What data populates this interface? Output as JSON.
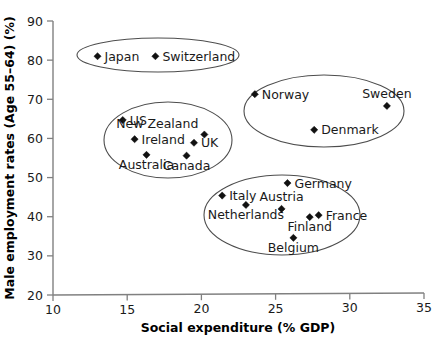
{
  "chart_data": {
    "type": "scatter",
    "title": "",
    "xlabel": "Social expenditure (% GDP)",
    "ylabel": "Male employment rates (Age 55–64) (%)",
    "xlim": [
      10,
      35
    ],
    "ylim": [
      20,
      90
    ],
    "xticks": [
      10,
      15,
      20,
      25,
      30,
      35
    ],
    "yticks": [
      20,
      30,
      40,
      50,
      60,
      70,
      80,
      90
    ],
    "xtick_labels": [
      "10",
      "15",
      "20",
      "25",
      "30",
      "35"
    ],
    "ytick_labels": [
      "20",
      "30",
      "40",
      "50",
      "60",
      "70",
      "80",
      "90"
    ],
    "grid": false,
    "legend": "none",
    "marker": "diamond",
    "marker_color": "#111111",
    "points": [
      {
        "label": "Japan",
        "x": 13.0,
        "y": 81.0,
        "label_pos": "right"
      },
      {
        "label": "Switzerland",
        "x": 16.9,
        "y": 81.0,
        "label_pos": "right"
      },
      {
        "label": "US",
        "x": 14.7,
        "y": 64.7,
        "label_pos": "right"
      },
      {
        "label": "New Zealand",
        "x": 20.2,
        "y": 61.0,
        "label_pos": "below-left"
      },
      {
        "label": "Ireland",
        "x": 15.5,
        "y": 59.8,
        "label_pos": "right"
      },
      {
        "label": "UK",
        "x": 19.5,
        "y": 58.9,
        "label_pos": "right"
      },
      {
        "label": "Australia",
        "x": 16.3,
        "y": 55.8,
        "label_pos": "below"
      },
      {
        "label": "Canada",
        "x": 19.0,
        "y": 55.6,
        "label_pos": "below"
      },
      {
        "label": "Norway",
        "x": 23.6,
        "y": 71.3,
        "label_pos": "right"
      },
      {
        "label": "Sweden",
        "x": 32.5,
        "y": 68.3,
        "label_pos": "above"
      },
      {
        "label": "Denmark",
        "x": 27.6,
        "y": 62.2,
        "label_pos": "right"
      },
      {
        "label": "Germany",
        "x": 25.8,
        "y": 48.6,
        "label_pos": "right"
      },
      {
        "label": "Italy",
        "x": 21.4,
        "y": 45.4,
        "label_pos": "right"
      },
      {
        "label": "Netherlands",
        "x": 23.0,
        "y": 43.0,
        "label_pos": "below"
      },
      {
        "label": "Austria",
        "x": 25.4,
        "y": 42.0,
        "label_pos": "above"
      },
      {
        "label": "Finland",
        "x": 27.3,
        "y": 39.9,
        "label_pos": "below"
      },
      {
        "label": "France",
        "x": 27.9,
        "y": 40.4,
        "label_pos": "right"
      },
      {
        "label": "Belgium",
        "x": 26.2,
        "y": 34.6,
        "label_pos": "below"
      }
    ],
    "clusters": [
      {
        "name": "high-employment-low-spend",
        "cx": 158,
        "cy": 55,
        "rx": 81,
        "ry": 17
      },
      {
        "name": "anglo-liberal",
        "cx": 168,
        "cy": 140,
        "rx": 64,
        "ry": 38
      },
      {
        "name": "nordic",
        "cx": 324,
        "cy": 111,
        "rx": 80,
        "ry": 36
      },
      {
        "name": "continental-european",
        "cx": 282,
        "cy": 215,
        "rx": 78,
        "ry": 40
      }
    ]
  },
  "axis": {
    "x_label": "Social expenditure (% GDP)",
    "y_label": "Male employment rates (Age 55–64) (%)"
  }
}
